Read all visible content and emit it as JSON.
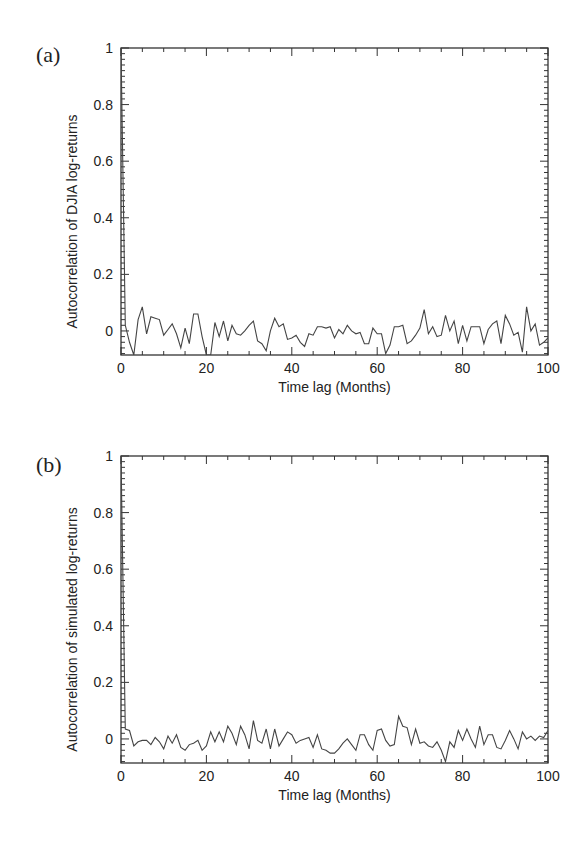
{
  "chart_data": [
    {
      "panel": "(a)",
      "type": "line",
      "title": "",
      "xlabel": "Time lag (Months)",
      "ylabel": "Autocorrelation of DJIA log-returns",
      "xlim": [
        0,
        100
      ],
      "ylim": [
        -0.085,
        1
      ],
      "xticks": [
        0,
        20,
        40,
        60,
        80,
        100
      ],
      "yticks": [
        0,
        0.2,
        0.4,
        0.6,
        0.8,
        1
      ],
      "xtick_labels": [
        "0",
        "20",
        "40",
        "60",
        "80",
        "100"
      ],
      "ytick_labels": [
        "0",
        "0.2",
        "0.4",
        "0.6",
        "0.8",
        "1"
      ],
      "grid": false,
      "legend": null,
      "x": [
        0,
        1,
        2,
        3,
        4,
        5,
        6,
        7,
        8,
        9,
        10,
        11,
        12,
        13,
        14,
        15,
        16,
        17,
        18,
        19,
        20,
        21,
        22,
        23,
        24,
        25,
        26,
        27,
        28,
        29,
        30,
        31,
        32,
        33,
        34,
        35,
        36,
        37,
        38,
        39,
        40,
        41,
        42,
        43,
        44,
        45,
        46,
        47,
        48,
        49,
        50,
        51,
        52,
        53,
        54,
        55,
        56,
        57,
        58,
        59,
        60,
        61,
        62,
        63,
        64,
        65,
        66,
        67,
        68,
        69,
        70,
        71,
        72,
        73,
        74,
        75,
        76,
        77,
        78,
        79,
        80,
        81,
        82,
        83,
        84,
        85,
        86,
        87,
        88,
        89,
        90,
        91,
        92,
        93,
        94,
        95,
        96,
        97,
        98,
        99,
        100
      ],
      "series": [
        {
          "name": "DJIA",
          "values": [
            1.0,
            0.02,
            -0.04,
            -0.085,
            0.04,
            0.085,
            -0.01,
            0.05,
            0.045,
            0.04,
            -0.015,
            0.005,
            0.025,
            -0.01,
            -0.06,
            0.01,
            -0.045,
            0.06,
            0.06,
            -0.02,
            -0.085,
            -0.085,
            0.03,
            -0.02,
            0.035,
            -0.035,
            0.02,
            -0.01,
            -0.015,
            0.0,
            0.02,
            0.035,
            -0.035,
            -0.045,
            -0.07,
            0.0,
            0.045,
            0.015,
            0.025,
            -0.03,
            -0.025,
            -0.015,
            -0.04,
            -0.055,
            -0.01,
            -0.015,
            0.015,
            0.015,
            0.01,
            0.015,
            -0.025,
            0.005,
            -0.01,
            0.02,
            0.0,
            -0.01,
            -0.005,
            -0.045,
            -0.045,
            0.01,
            -0.01,
            -0.01,
            -0.08,
            -0.05,
            0.015,
            0.015,
            0.02,
            -0.045,
            -0.035,
            -0.015,
            0.01,
            0.075,
            -0.01,
            0.015,
            -0.02,
            -0.015,
            0.055,
            0.0,
            0.035,
            -0.045,
            0.02,
            -0.035,
            0.015,
            0.015,
            0.015,
            -0.045,
            0.005,
            0.025,
            0.035,
            -0.045,
            0.055,
            0.025,
            -0.015,
            -0.005,
            -0.075,
            0.085,
            0.0,
            0.025,
            -0.05,
            -0.04,
            -0.025
          ]
        }
      ]
    },
    {
      "panel": "(b)",
      "type": "line",
      "title": "",
      "xlabel": "Time lag (Months)",
      "ylabel": "Autocorrelation of simulated log-returns",
      "xlim": [
        0,
        100
      ],
      "ylim": [
        -0.085,
        1
      ],
      "xticks": [
        0,
        20,
        40,
        60,
        80,
        100
      ],
      "yticks": [
        0,
        0.2,
        0.4,
        0.6,
        0.8,
        1
      ],
      "xtick_labels": [
        "0",
        "20",
        "40",
        "60",
        "80",
        "100"
      ],
      "ytick_labels": [
        "0",
        "0.2",
        "0.4",
        "0.6",
        "0.8",
        "1"
      ],
      "grid": false,
      "legend": null,
      "x": [
        0,
        1,
        2,
        3,
        4,
        5,
        6,
        7,
        8,
        9,
        10,
        11,
        12,
        13,
        14,
        15,
        16,
        17,
        18,
        19,
        20,
        21,
        22,
        23,
        24,
        25,
        26,
        27,
        28,
        29,
        30,
        31,
        32,
        33,
        34,
        35,
        36,
        37,
        38,
        39,
        40,
        41,
        42,
        43,
        44,
        45,
        46,
        47,
        48,
        49,
        50,
        51,
        52,
        53,
        54,
        55,
        56,
        57,
        58,
        59,
        60,
        61,
        62,
        63,
        64,
        65,
        66,
        67,
        68,
        69,
        70,
        71,
        72,
        73,
        74,
        75,
        76,
        77,
        78,
        79,
        80,
        81,
        82,
        83,
        84,
        85,
        86,
        87,
        88,
        89,
        90,
        91,
        92,
        93,
        94,
        95,
        96,
        97,
        98,
        99,
        100
      ],
      "series": [
        {
          "name": "Simulated",
          "values": [
            1.0,
            0.035,
            0.03,
            -0.025,
            -0.01,
            -0.005,
            -0.005,
            -0.02,
            0.005,
            -0.01,
            -0.035,
            0.01,
            -0.015,
            0.015,
            -0.03,
            -0.04,
            -0.02,
            -0.015,
            -0.005,
            -0.04,
            -0.025,
            0.025,
            -0.01,
            0.025,
            -0.01,
            0.045,
            0.02,
            -0.02,
            0.045,
            0.015,
            -0.035,
            0.065,
            -0.005,
            -0.015,
            0.035,
            -0.035,
            0.035,
            -0.025,
            0.0,
            0.025,
            0.015,
            -0.015,
            -0.005,
            0.0,
            0.005,
            -0.03,
            0.015,
            -0.035,
            -0.04,
            -0.05,
            -0.05,
            -0.035,
            -0.015,
            0.0,
            -0.02,
            -0.04,
            0.015,
            0.015,
            -0.02,
            -0.04,
            0.03,
            0.035,
            -0.005,
            -0.025,
            -0.02,
            0.08,
            0.045,
            0.04,
            -0.02,
            0.035,
            -0.015,
            -0.01,
            -0.025,
            -0.03,
            -0.01,
            -0.04,
            -0.08,
            -0.01,
            -0.03,
            0.03,
            -0.005,
            0.035,
            0.0,
            -0.03,
            0.045,
            -0.02,
            0.015,
            0.015,
            -0.03,
            -0.035,
            -0.005,
            0.03,
            0.0,
            -0.035,
            0.025,
            0.0,
            0.01,
            -0.005,
            0.01,
            0.005,
            0.03
          ]
        }
      ]
    }
  ],
  "panels": [
    {
      "label": "(a)",
      "ylabel": "Autocorrelation of DJIA log-returns",
      "xlabel": "Time lag (Months)"
    },
    {
      "label": "(b)",
      "ylabel": "Autocorrelation of simulated log-returns",
      "xlabel": "Time lag (Months)"
    }
  ]
}
